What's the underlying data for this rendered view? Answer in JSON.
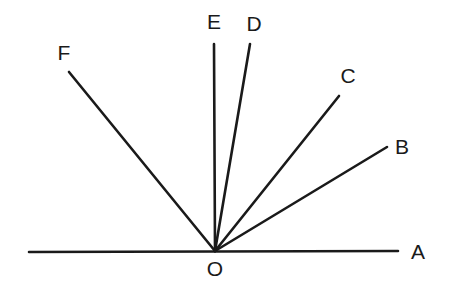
{
  "diagram": {
    "type": "angles-at-point-on-line",
    "vertex": {
      "name": "O",
      "x": 215,
      "y": 251,
      "label_x": 215,
      "label_y": 276
    },
    "baseline": {
      "x1": 29,
      "y1": 252,
      "x2": 398,
      "y2": 251
    },
    "rays": [
      {
        "name": "A",
        "x2": 398,
        "y2": 251,
        "label_x": 418,
        "label_y": 259
      },
      {
        "name": "B",
        "x2": 387,
        "y2": 147,
        "label_x": 402,
        "label_y": 154
      },
      {
        "name": "C",
        "x2": 339,
        "y2": 96,
        "label_x": 348,
        "label_y": 83
      },
      {
        "name": "D",
        "x2": 250,
        "y2": 44,
        "label_x": 254,
        "label_y": 31
      },
      {
        "name": "E",
        "x2": 214,
        "y2": 44,
        "label_x": 214,
        "label_y": 29
      },
      {
        "name": "F",
        "x2": 69,
        "y2": 72,
        "label_x": 64,
        "label_y": 60
      }
    ],
    "labels": [
      "A",
      "B",
      "C",
      "D",
      "E",
      "F",
      "O"
    ],
    "colors": {
      "line": "#1a1a1a",
      "background": "#ffffff"
    }
  }
}
